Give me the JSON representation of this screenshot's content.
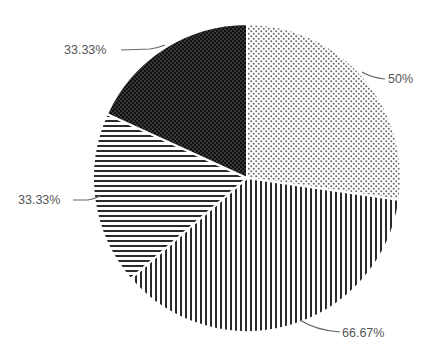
{
  "chart_data": {
    "type": "pie",
    "title": "",
    "start_angle_deg": 0,
    "direction": "clockwise",
    "slices": [
      {
        "label": "50%",
        "value": 50,
        "pattern": "dots-light",
        "fill": "#ffffff",
        "ink": "#555555"
      },
      {
        "label": "66.67%",
        "value": 66.67,
        "pattern": "vertical-stripes",
        "fill": "#ffffff",
        "ink": "#2b2b2b"
      },
      {
        "label": "33.33%",
        "value": 33.33,
        "pattern": "horizontal-stripes",
        "fill": "#ffffff",
        "ink": "#2b2b2b"
      },
      {
        "label": "33.33%",
        "value": 33.33,
        "pattern": "dots-dark",
        "fill": "#1a1a1a",
        "ink": "#5a5a5a"
      }
    ],
    "legend": null
  },
  "labels": {
    "s0": "50%",
    "s1": "66.67%",
    "s2": "33.33%",
    "s3": "33.33%"
  }
}
